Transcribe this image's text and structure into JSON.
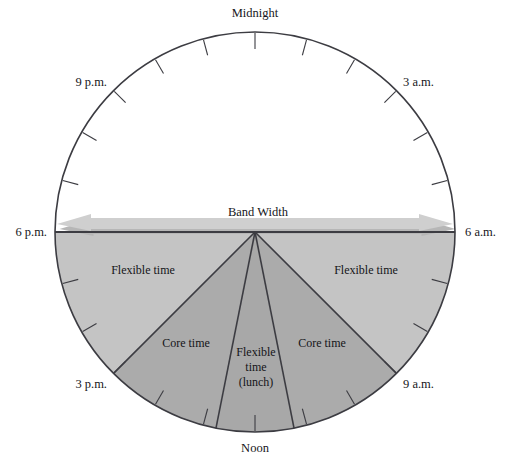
{
  "diagram": {
    "type": "flextime-clock-face",
    "title_label": "Band Width",
    "geometry": {
      "center_x": 255,
      "center_y": 232,
      "radius": 200
    },
    "colors": {
      "outline": "#3c3c42",
      "flexible_fill": "#c4c4c4",
      "core_fill": "#ababab",
      "lunch_fill": "#a8a8a8",
      "arrow_fill": "#cfcfcf",
      "arrow_shadow": "#b6b6b6",
      "background": "#ffffff",
      "text": "#16161a"
    },
    "hour_labels": [
      {
        "name": "midnight",
        "text": "Midnight",
        "hour": 0,
        "angle_deg": 0,
        "x": 255,
        "y": 17
      },
      {
        "name": "three-am",
        "text": "3 a.m.",
        "hour": 3,
        "angle_deg": 90,
        "x": 424,
        "y": 86
      },
      {
        "name": "six-am",
        "text": "6 a.m.",
        "hour": 6,
        "angle_deg": 180,
        "x": 489,
        "y": 236
      },
      {
        "name": "nine-am",
        "text": "9 a.m.",
        "hour": 9,
        "angle_deg": 270,
        "x": 424,
        "y": 388
      },
      {
        "name": "noon",
        "text": "Noon",
        "hour": 12,
        "angle_deg": 0,
        "x": 255,
        "y": 452
      },
      {
        "name": "three-pm",
        "text": "3 p.m.",
        "hour": 15,
        "angle_deg": 90,
        "x": 88,
        "y": 388
      },
      {
        "name": "six-pm",
        "text": "6 p.m.",
        "hour": 18,
        "angle_deg": 180,
        "x": 22,
        "y": 236
      },
      {
        "name": "nine-pm",
        "text": "9 p.m.",
        "hour": 21,
        "angle_deg": 270,
        "x": 88,
        "y": 86
      }
    ],
    "band_width_arrow": {
      "label": "Band Width",
      "label_x": 258,
      "label_y": 216,
      "span_from_hour_label": "6 p.m.",
      "span_to_hour_label": "6 a.m."
    },
    "sectors": [
      {
        "name": "flexible-time-left",
        "label": "Flexible time",
        "fill_key": "flexible_fill",
        "start_hour": 15.0,
        "end_hour": 18.0,
        "label_x": 143,
        "label_y": 274
      },
      {
        "name": "core-time-left",
        "label": "Core time",
        "fill_key": "core_fill",
        "start_hour": 12.75,
        "end_hour": 15.0,
        "label_x": 186,
        "label_y": 347
      },
      {
        "name": "flexible-time-lunch",
        "label": "Flexible time (lunch)",
        "label_line_1": "Flexible",
        "label_line_2": "time",
        "label_line_3": "(lunch)",
        "fill_key": "lunch_fill",
        "start_hour": 11.25,
        "end_hour": 12.75,
        "label_x": 256,
        "label_y": 356
      },
      {
        "name": "core-time-right",
        "label": "Core time",
        "fill_key": "core_fill",
        "start_hour": 9.0,
        "end_hour": 11.25,
        "label_x": 322,
        "label_y": 347
      },
      {
        "name": "flexible-time-right",
        "label": "Flexible time",
        "fill_key": "flexible_fill",
        "start_hour": 6.0,
        "end_hour": 9.0,
        "label_x": 366,
        "label_y": 274
      }
    ],
    "tick_marks": {
      "count": 24,
      "description": "hour ticks pointing inward from circle edge"
    }
  }
}
